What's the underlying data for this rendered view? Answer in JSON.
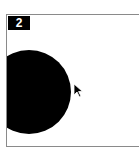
{
  "panel": {
    "number_label": "2",
    "shape": "filled-circle",
    "shape_color": "#000000",
    "cursor": "arrow-cursor-icon"
  }
}
